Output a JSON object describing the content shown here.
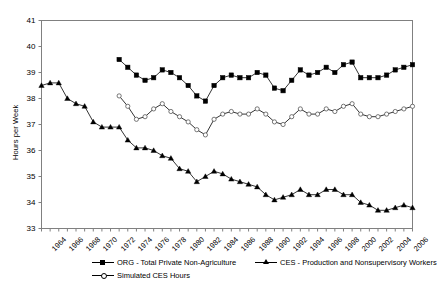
{
  "chart_data": {
    "type": "line",
    "title": "",
    "xlabel": "",
    "ylabel": "Hours per Week",
    "ylim": [
      33,
      41
    ],
    "ytick_labels": [
      "33",
      "34",
      "35",
      "36",
      "37",
      "38",
      "39",
      "40",
      "41"
    ],
    "xlim": [
      1964,
      2007
    ],
    "xtick_labels": [
      "1964",
      "1966",
      "1968",
      "1970",
      "1972",
      "1974",
      "1976",
      "1978",
      "1980",
      "1982",
      "1984",
      "1986",
      "1988",
      "1990",
      "1992",
      "1994",
      "1996",
      "1998",
      "2000",
      "2002",
      "2004",
      "2006"
    ],
    "grid": false,
    "legend_position": "bottom",
    "series": [
      {
        "name": "ORG - Total Private Non-Agriculture",
        "marker": "filled-square",
        "x": [
          1973,
          1974,
          1975,
          1976,
          1977,
          1978,
          1979,
          1980,
          1981,
          1982,
          1983,
          1984,
          1985,
          1986,
          1987,
          1988,
          1989,
          1990,
          1991,
          1992,
          1993,
          1994,
          1995,
          1996,
          1997,
          1998,
          1999,
          2000,
          2001,
          2002,
          2003,
          2004,
          2005,
          2006,
          2007
        ],
        "values": [
          39.5,
          39.2,
          38.9,
          38.7,
          38.8,
          39.1,
          39.0,
          38.8,
          38.5,
          38.1,
          37.9,
          38.5,
          38.8,
          38.9,
          38.8,
          38.8,
          39.0,
          38.9,
          38.4,
          38.3,
          38.7,
          39.1,
          38.9,
          39.0,
          39.2,
          39.0,
          39.3,
          39.4,
          38.8,
          38.8,
          38.8,
          38.9,
          39.1,
          39.2,
          39.3
        ]
      },
      {
        "name": "CES - Production and Nonsupervisory Workers",
        "marker": "filled-triangle",
        "x": [
          1964,
          1965,
          1966,
          1967,
          1968,
          1969,
          1970,
          1971,
          1972,
          1973,
          1974,
          1975,
          1976,
          1977,
          1978,
          1979,
          1980,
          1981,
          1982,
          1983,
          1984,
          1985,
          1986,
          1987,
          1988,
          1989,
          1990,
          1991,
          1992,
          1993,
          1994,
          1995,
          1996,
          1997,
          1998,
          1999,
          2000,
          2001,
          2002,
          2003,
          2004,
          2005,
          2006,
          2007
        ],
        "values": [
          38.5,
          38.6,
          38.6,
          38.0,
          37.8,
          37.7,
          37.1,
          36.9,
          36.9,
          36.9,
          36.4,
          36.1,
          36.1,
          36.0,
          35.8,
          35.7,
          35.3,
          35.2,
          34.8,
          35.0,
          35.2,
          35.1,
          34.9,
          34.8,
          34.7,
          34.6,
          34.3,
          34.1,
          34.2,
          34.3,
          34.5,
          34.3,
          34.3,
          34.5,
          34.5,
          34.3,
          34.3,
          34.0,
          33.9,
          33.7,
          33.7,
          33.8,
          33.9,
          33.8
        ]
      },
      {
        "name": "Simulated CES Hours",
        "marker": "open-circle",
        "x": [
          1973,
          1974,
          1975,
          1976,
          1977,
          1978,
          1979,
          1980,
          1981,
          1982,
          1983,
          1984,
          1985,
          1986,
          1987,
          1988,
          1989,
          1990,
          1991,
          1992,
          1993,
          1994,
          1995,
          1996,
          1997,
          1998,
          1999,
          2000,
          2001,
          2002,
          2003,
          2004,
          2005,
          2006,
          2007
        ],
        "values": [
          38.1,
          37.7,
          37.2,
          37.3,
          37.6,
          37.8,
          37.5,
          37.3,
          37.1,
          36.8,
          36.6,
          37.2,
          37.4,
          37.5,
          37.4,
          37.4,
          37.6,
          37.4,
          37.1,
          37.0,
          37.3,
          37.6,
          37.4,
          37.4,
          37.6,
          37.5,
          37.7,
          37.8,
          37.4,
          37.3,
          37.3,
          37.4,
          37.5,
          37.6,
          37.7
        ]
      }
    ]
  },
  "legend": {
    "entries": [
      {
        "label": "ORG - Total Private Non-Agriculture",
        "marker": "filled-square"
      },
      {
        "label": "CES - Production and Nonsupervisory Workers",
        "marker": "filled-triangle"
      },
      {
        "label": "Simulated CES Hours",
        "marker": "open-circle"
      }
    ]
  },
  "colors": {
    "series_line": "#000000",
    "axis": "#808080",
    "background": "#ffffff"
  }
}
